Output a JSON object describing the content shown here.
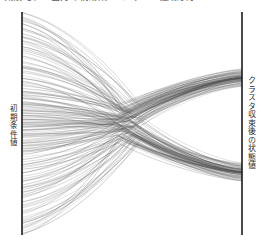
{
  "figure": {
    "title_clipped": "気候モデル出力の軌跡束 ー パラレル座標表示",
    "background_color": "#ffffff",
    "line_color": "#555555",
    "axis_color": "#1a1a1a"
  },
  "axes": {
    "left": {
      "label": "初期条件値",
      "x_px": 22,
      "top_px": 12,
      "bottom_px": 235
    },
    "right": {
      "label": "クラスタ収束後の状態値",
      "x_px": 242,
      "top_px": 12,
      "bottom_px": 235
    }
  },
  "chart_data": {
    "type": "line",
    "title": "気候モデル出力の軌跡束 ー パラレル座標表示",
    "xlabel": "",
    "ylabel": "",
    "grid": false,
    "legend": "none",
    "x": [
      0,
      1
    ],
    "xlim": [
      0,
      1
    ],
    "ylim": [
      0,
      1
    ],
    "axis_positions_px": {
      "left_x": 22,
      "right_x": 242,
      "top_y": 12,
      "bottom_y": 235
    },
    "n_lines": 150,
    "convergence_bands": [
      {
        "name": "upper-band",
        "center_y_px": 78,
        "half_width_px": 9,
        "density": "high"
      },
      {
        "name": "lower-band",
        "center_y_px": 172,
        "half_width_px": 9,
        "density": "high"
      }
    ],
    "waist": {
      "x_px": 128,
      "center_y_px": 124,
      "half_width_px": 16
    },
    "series": [
      {
        "name": "upper-bundle",
        "target_y_px": 78,
        "count": 75,
        "start_y_range_px": [
          12,
          150
        ],
        "values": [
          0.0,
          0.7
        ]
      },
      {
        "name": "lower-bundle",
        "target_y_px": 172,
        "count": 75,
        "start_y_range_px": [
          95,
          235
        ],
        "values": [
          1.0,
          0.28
        ]
      }
    ]
  }
}
